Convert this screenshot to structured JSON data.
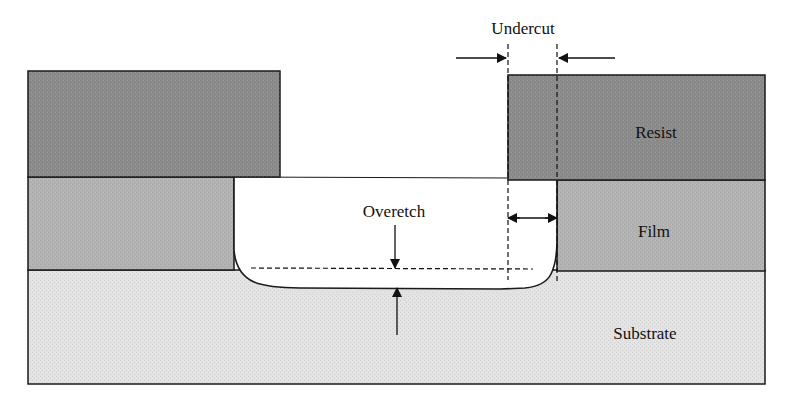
{
  "diagram": {
    "layers": {
      "resist": {
        "label": "Resist",
        "color": "#8c8c8c"
      },
      "film": {
        "label": "Film",
        "color": "#b3b3b3"
      },
      "substrate": {
        "label": "Substrate",
        "color": "#e3e3e3"
      }
    },
    "annotations": {
      "undercut": "Undercut",
      "overetch": "Overetch"
    },
    "colors": {
      "outline": "#1a1a1a",
      "opening": "#ffffff"
    }
  }
}
